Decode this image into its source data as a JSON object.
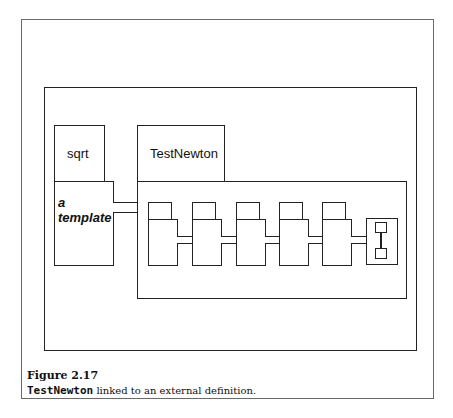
{
  "figure": {
    "boxes": {
      "sqrt_label": "sqrt",
      "template_label_line1": "a",
      "template_label_line2": "template",
      "testnewton_label": "TestNewton"
    },
    "module_count": 5,
    "caption": {
      "title": "Figure 2.17",
      "code": "TestNewton",
      "text": " linked to an external definition."
    }
  }
}
